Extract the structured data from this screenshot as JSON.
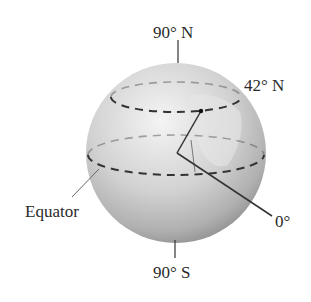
{
  "diagram": {
    "type": "globe-latitude-longitude",
    "labels": {
      "north_pole": "90° N",
      "south_pole": "90° S",
      "latitude": "42° N",
      "equator": "Equator",
      "prime_meridian": "0°"
    },
    "colors": {
      "sphere_light": "#f2f2f2",
      "sphere_mid": "#c9c9c9",
      "sphere_dark": "#8e8e8e",
      "lines": "#333333",
      "text": "#2a2a2a"
    }
  }
}
